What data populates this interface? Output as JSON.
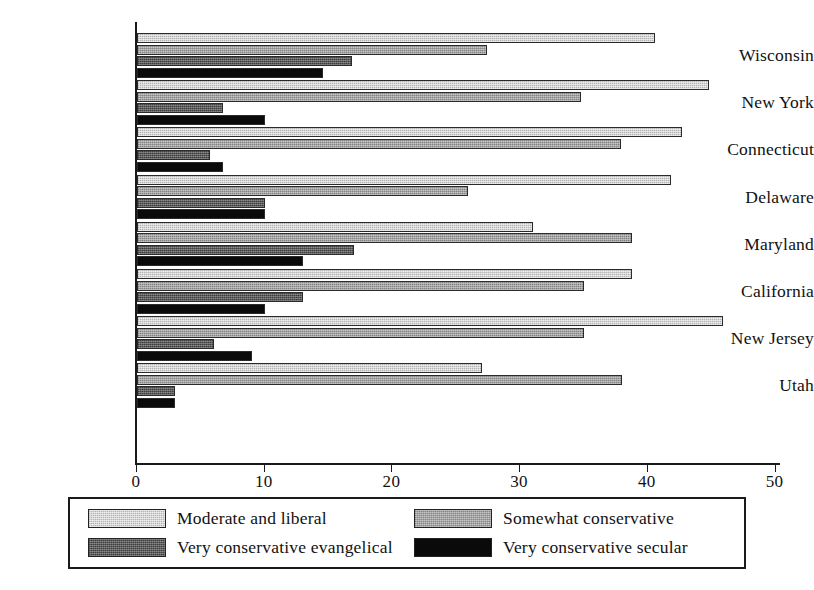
{
  "chart_data": {
    "type": "bar",
    "orientation": "horizontal",
    "title": "",
    "subtitle": "",
    "xlabel": "",
    "ylabel": "",
    "xlim": [
      0,
      50
    ],
    "xticks": [
      0,
      10,
      20,
      30,
      40,
      50
    ],
    "xtick_labels": [
      "0",
      "10",
      "20",
      "30",
      "40",
      "50"
    ],
    "grid": false,
    "legend_position": "bottom",
    "categories": [
      "Wisconsin",
      "New York",
      "Connecticut",
      "Delaware",
      "Maryland",
      "California",
      "New Jersey",
      "Utah"
    ],
    "series": [
      {
        "name": "Moderate and liberal",
        "color": "#d5d5d5",
        "values": [
          40.6,
          44.8,
          42.7,
          41.8,
          31.0,
          38.8,
          45.9,
          27.0
        ]
      },
      {
        "name": "Somewhat conservative",
        "color": "#a3a3a3",
        "values": [
          27.4,
          34.8,
          37.9,
          25.9,
          38.8,
          35.0,
          35.0,
          38.0
        ]
      },
      {
        "name": "Very conservative evangelical",
        "color": "#5d5d5d",
        "values": [
          16.8,
          6.7,
          5.7,
          10.0,
          17.0,
          13.0,
          6.0,
          3.0
        ]
      },
      {
        "name": "Very conservative secular",
        "color": "#0a0a0a",
        "values": [
          14.6,
          10.0,
          6.7,
          10.0,
          13.0,
          10.0,
          9.0,
          3.0
        ]
      }
    ]
  }
}
